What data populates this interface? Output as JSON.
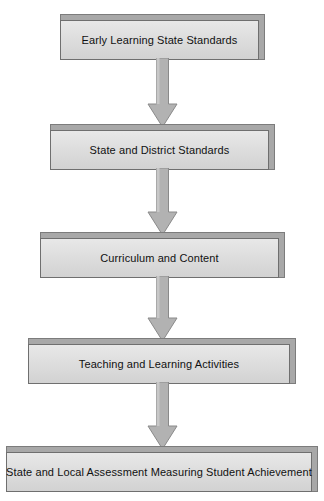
{
  "diagram": {
    "type": "vertical-flowchart",
    "orientation": "top-to-bottom",
    "node_count": 5,
    "connector_count": 4,
    "colors": {
      "node_fill": "#dedede",
      "node_border": "#6f6f6f",
      "node_top_bevel": "#a8a8a8",
      "arrow_fill": "#b0b0b0",
      "arrow_border": "#8a8a8a",
      "text": "#111111",
      "background": "#ffffff"
    },
    "nodes": [
      {
        "id": "node-1",
        "label": "Early Learning State Standards",
        "order": 1,
        "x": 60,
        "y": 14,
        "width": 205,
        "height": 46
      },
      {
        "id": "node-2",
        "label": "State and District Standards",
        "order": 2,
        "x": 50,
        "y": 124,
        "width": 225,
        "height": 46
      },
      {
        "id": "node-3",
        "label": "Curriculum and Content",
        "order": 3,
        "x": 40,
        "y": 232,
        "width": 245,
        "height": 46
      },
      {
        "id": "node-4",
        "label": "Teaching and Learning Activities",
        "order": 4,
        "x": 28,
        "y": 338,
        "width": 268,
        "height": 46
      },
      {
        "id": "node-5",
        "label": "State and Local Assessment Measuring Student Achievement",
        "order": 5,
        "x": 6,
        "y": 446,
        "width": 312,
        "height": 46
      }
    ],
    "connectors": [
      {
        "id": "arrow-1",
        "from": "node-1",
        "to": "node-2",
        "direction": "down",
        "x": 147,
        "y": 58,
        "width": 31,
        "height": 70
      },
      {
        "id": "arrow-2",
        "from": "node-2",
        "to": "node-3",
        "direction": "down",
        "x": 147,
        "y": 168,
        "width": 31,
        "height": 68
      },
      {
        "id": "arrow-3",
        "from": "node-3",
        "to": "node-4",
        "direction": "down",
        "x": 147,
        "y": 276,
        "width": 31,
        "height": 66
      },
      {
        "id": "arrow-4",
        "from": "node-4",
        "to": "node-5",
        "direction": "down",
        "x": 147,
        "y": 382,
        "width": 31,
        "height": 68
      }
    ]
  }
}
